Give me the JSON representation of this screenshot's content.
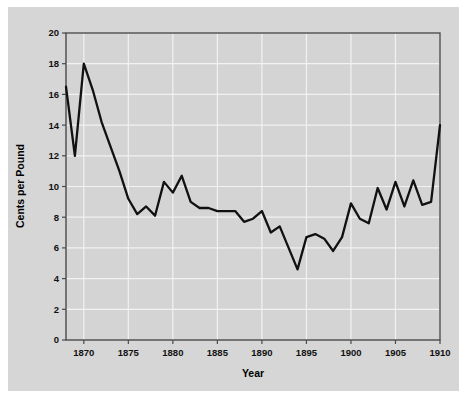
{
  "figure": {
    "background_color": "#d6d6d6",
    "outer_color": "#ffffff",
    "plot_background_color": "#d4d4d4",
    "grid_color": "#f2f2f2",
    "axis_color": "#4a4a4a",
    "line_color": "#111111"
  },
  "chart_data": {
    "type": "line",
    "title": "",
    "xlabel": "Year",
    "ylabel": "Cents per Pound",
    "xlim": [
      1868,
      1910
    ],
    "ylim": [
      0,
      20
    ],
    "xticks": [
      1870,
      1875,
      1880,
      1885,
      1890,
      1895,
      1900,
      1905,
      1910
    ],
    "yticks": [
      0,
      2,
      4,
      6,
      8,
      10,
      12,
      14,
      16,
      18,
      20
    ],
    "grid": true,
    "legend": "none",
    "series": [
      {
        "name": "Price",
        "x": [
          1868,
          1869,
          1870,
          1871,
          1872,
          1873,
          1874,
          1875,
          1876,
          1877,
          1878,
          1879,
          1880,
          1881,
          1882,
          1883,
          1884,
          1885,
          1886,
          1887,
          1888,
          1889,
          1890,
          1891,
          1892,
          1893,
          1894,
          1895,
          1896,
          1897,
          1898,
          1899,
          1900,
          1901,
          1902,
          1903,
          1904,
          1905,
          1906,
          1907,
          1908,
          1909,
          1910
        ],
        "values": [
          16.5,
          12.0,
          18.0,
          16.3,
          14.2,
          12.6,
          11.0,
          9.2,
          8.2,
          8.7,
          8.1,
          10.3,
          9.6,
          10.7,
          9.0,
          8.6,
          8.6,
          8.4,
          8.4,
          8.4,
          7.7,
          7.9,
          8.4,
          7.0,
          7.4,
          6.0,
          4.6,
          6.7,
          6.9,
          6.6,
          5.8,
          6.7,
          8.9,
          7.9,
          7.6,
          9.9,
          8.5,
          10.3,
          8.7,
          10.4,
          8.8,
          9.0,
          14.0
        ]
      }
    ]
  },
  "axis": {
    "x_title": "Year",
    "y_title": "Cents per Pound",
    "x_tick_labels": [
      "1870",
      "1875",
      "1880",
      "1885",
      "1890",
      "1895",
      "1900",
      "1905",
      "1910"
    ],
    "y_tick_labels": [
      "0",
      "2",
      "4",
      "6",
      "8",
      "10",
      "12",
      "14",
      "16",
      "18",
      "20"
    ]
  }
}
